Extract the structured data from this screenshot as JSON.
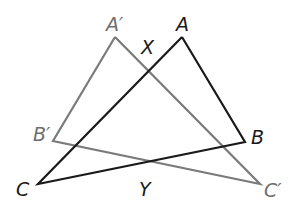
{
  "diagram": {
    "colors": {
      "original": "#1a1a1a",
      "image": "#7a7a7a",
      "background": "#ffffff"
    },
    "triangles": [
      {
        "name": "ABC",
        "color": "#1a1a1a",
        "vertices": {
          "A": [
            182,
            37
          ],
          "B": [
            245,
            142
          ],
          "C": [
            38,
            184
          ]
        }
      },
      {
        "name": "A'B'C'",
        "color": "#7a7a7a",
        "vertices": {
          "A'": [
            115,
            37
          ],
          "B'": [
            53,
            141
          ],
          "C'": [
            260,
            184
          ]
        }
      }
    ],
    "labels": {
      "A": "A",
      "B": "B",
      "C": "C",
      "A_prime": "A′",
      "B_prime": "B′",
      "C_prime": "C′",
      "X": "X",
      "Y": "Y"
    },
    "intersection_points": {
      "X": [
        150,
        72
      ],
      "Y": [
        148,
        162
      ]
    }
  }
}
